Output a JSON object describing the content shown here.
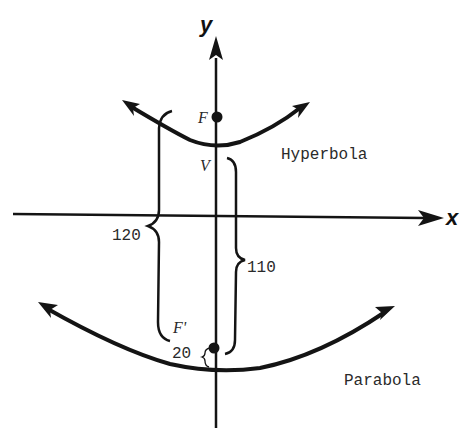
{
  "diagram": {
    "type": "conic sections on coordinate axes",
    "axes": {
      "x_label": "x",
      "y_label": "y"
    },
    "curves": [
      {
        "name": "Hyperbola",
        "label": "Hyperbola",
        "opens": "up",
        "focus_label": "F",
        "vertex_label": "V"
      },
      {
        "name": "Parabola",
        "label": "Parabola",
        "opens": "up",
        "focus_label": "F'"
      }
    ],
    "measurements": [
      {
        "label": "120",
        "description": "distance spanning hyperbola branch region down to F'"
      },
      {
        "label": "110",
        "description": "distance from V down to F'"
      },
      {
        "label": "20",
        "description": "distance from F' to parabola vertex"
      }
    ]
  },
  "labels": {
    "x": "x",
    "y": "y",
    "F": "F",
    "V": "V",
    "F_prime": "F'",
    "hyperbola": "Hyperbola",
    "parabola": "Parabola",
    "m120": "120",
    "m110": "110",
    "m20": "20"
  },
  "colors": {
    "ink": "#141414",
    "text": "#2a2a2a",
    "background": "#ffffff"
  }
}
